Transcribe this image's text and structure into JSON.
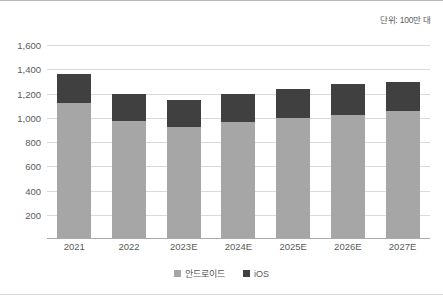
{
  "unit_note": "단위: 100만 대",
  "legend": [
    {
      "label": "안드로이드",
      "color": "#a6a6a6"
    },
    {
      "label": "iOS",
      "color": "#404040"
    }
  ],
  "chart_data": {
    "type": "bar",
    "stacked": true,
    "title": "",
    "subtitle": "",
    "xlabel": "",
    "ylabel": "",
    "annotations": [
      "단위: 100만 대"
    ],
    "grid": true,
    "legend_position": "bottom",
    "ylim": [
      0,
      1600
    ],
    "ytick_step": 200,
    "ytick_labels": [
      "1,600",
      "1,400",
      "1,200",
      "1,000",
      "800",
      "600",
      "400",
      "200"
    ],
    "ytick_values": [
      1600,
      1400,
      1200,
      1000,
      800,
      600,
      400,
      200
    ],
    "categories": [
      "2021",
      "2022",
      "2023E",
      "2024E",
      "2025E",
      "2026E",
      "2027E"
    ],
    "series": [
      {
        "name": "안드로이드",
        "color": "#a6a6a6",
        "values": [
          1120,
          970,
          920,
          965,
          995,
          1020,
          1055
        ]
      },
      {
        "name": "iOS",
        "color": "#404040",
        "values": [
          240,
          230,
          225,
          230,
          240,
          255,
          240
        ]
      }
    ],
    "totals": [
      1360,
      1200,
      1145,
      1195,
      1235,
      1275,
      1295
    ]
  }
}
